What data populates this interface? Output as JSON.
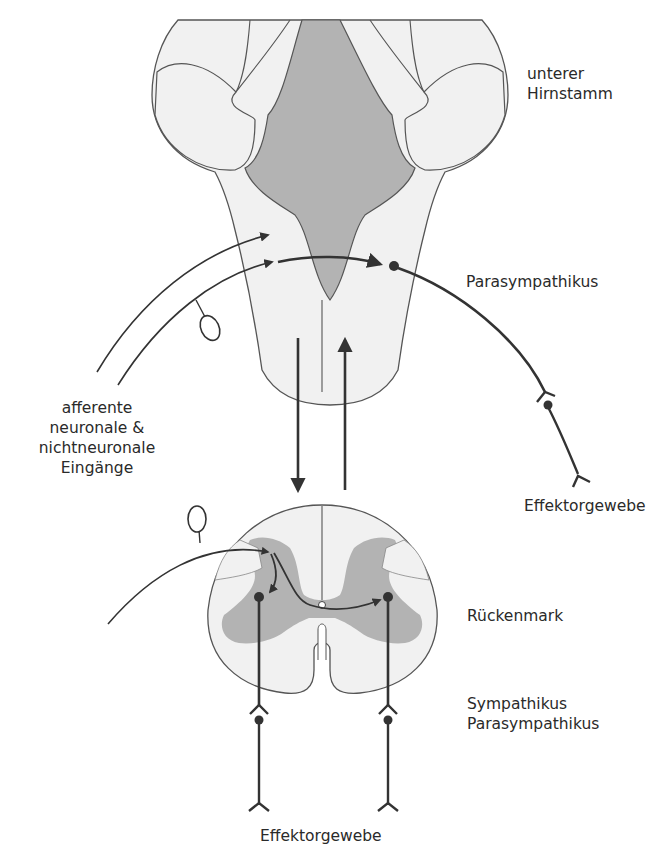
{
  "figure": {
    "type": "neuroanatomy-schematic",
    "colors": {
      "tissue_light": "#f1f1f1",
      "tissue_gray": "#b3b3b3",
      "outline": "#555555",
      "pathway": "#333333",
      "background": "#ffffff"
    }
  },
  "labels": {
    "lower_brainstem_line1": "unterer",
    "lower_brainstem_line2": "Hirnstamm",
    "parasympathetic_top": "Parasympathikus",
    "afferent_line1": "afferente",
    "afferent_line2": "neuronale &",
    "afferent_line3": "nichtneuronale",
    "afferent_line4": "Eingänge",
    "effector_right": "Effektorgewebe",
    "spinal_cord": "Rückenmark",
    "sympathetic": "Sympathikus",
    "parasympathetic_bottom": "Parasympathikus",
    "effector_bottom": "Effektorgewebe"
  },
  "structures": [
    {
      "name": "lower-brainstem",
      "shape": "cross-section"
    },
    {
      "name": "spinal-cord",
      "shape": "cross-section"
    }
  ],
  "pathways": [
    {
      "name": "afferent-input-1",
      "from": "periphery",
      "to": "brainstem"
    },
    {
      "name": "afferent-input-2",
      "from": "periphery (via ganglion)",
      "to": "brainstem"
    },
    {
      "name": "brainstem-parasympathetic-efferent",
      "to": "Effektorgewebe"
    },
    {
      "name": "descending-pathway",
      "from": "brainstem",
      "to": "spinal cord"
    },
    {
      "name": "ascending-pathway",
      "from": "spinal cord",
      "to": "brainstem"
    },
    {
      "name": "spinal-afferent",
      "from": "periphery (via dorsal root ganglion)",
      "to": "spinal cord"
    },
    {
      "name": "spinal-efferent-left",
      "to": "Effektorgewebe"
    },
    {
      "name": "spinal-efferent-right",
      "to": "Effektorgewebe"
    }
  ]
}
